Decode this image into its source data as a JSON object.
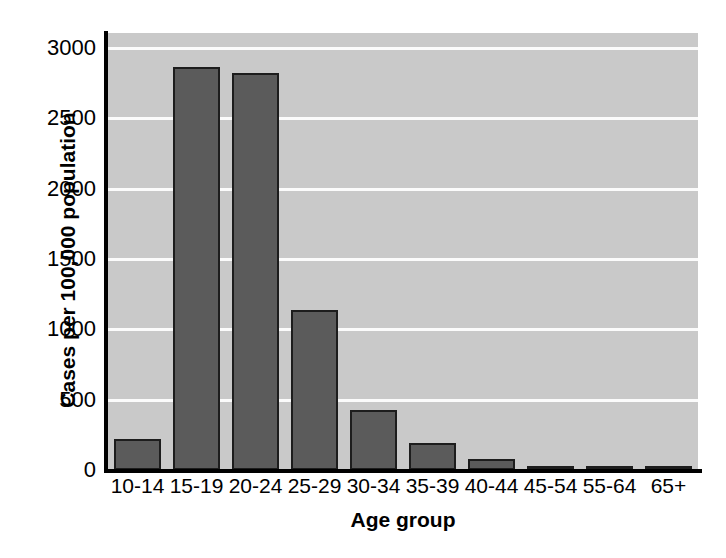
{
  "chart_data": {
    "type": "bar",
    "title": "",
    "xlabel": "Age group",
    "ylabel": "Cases per 100,000 population",
    "categories": [
      "10-14",
      "15-19",
      "20-24",
      "25-29",
      "30-34",
      "35-39",
      "40-44",
      "45-54",
      "55-64",
      "65+"
    ],
    "values": [
      220,
      2865,
      2820,
      1135,
      430,
      190,
      75,
      25,
      5,
      2
    ],
    "ylim": [
      0,
      3000
    ],
    "yticks": [
      0,
      500,
      1000,
      1500,
      2000,
      2500,
      3000
    ],
    "ytick_labels": [
      "0",
      "500",
      "1000",
      "1500",
      "2000",
      "2500",
      "3000"
    ],
    "grid": "horizontal",
    "legend": "none",
    "colors": {
      "bar_fill": "#5b5b5b",
      "bar_edge": "#1d1d1d",
      "plot_background": "#c9c9c9",
      "gridline": "#fbfbfb",
      "axis": "#000000",
      "figure_background": "#ffffff",
      "text": "#000000"
    }
  }
}
